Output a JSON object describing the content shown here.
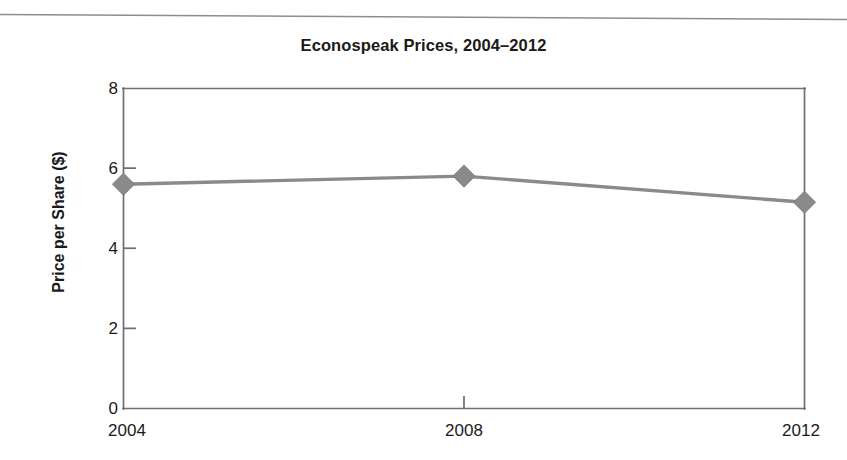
{
  "chart_data": {
    "type": "line",
    "title": "Econospeak Prices, 2004–2012",
    "xlabel": "",
    "ylabel": "Price per Share ($)",
    "x": [
      2004,
      2008,
      2012
    ],
    "xticklabels": [
      "2004",
      "2008",
      "2012"
    ],
    "yticklabels": [
      "0",
      "2",
      "4",
      "6",
      "8"
    ],
    "yticks": [
      0,
      2,
      4,
      6,
      8
    ],
    "ylim": [
      0,
      8
    ],
    "xlim": [
      2004,
      2012
    ],
    "grid": false,
    "legend": false,
    "marker": "diamond",
    "series": [
      {
        "name": "Price per Share",
        "values": [
          5.6,
          5.8,
          5.15
        ]
      }
    ],
    "colors": {
      "line": "#8a8a8a",
      "marker": "#8a8a8a",
      "axis": "#6e6e6e",
      "text": "#1a1a1a",
      "background": "#ffffff"
    }
  },
  "axis": {
    "y_labels": [
      "8",
      "6",
      "4",
      "2",
      "0"
    ],
    "x_labels": [
      "2004",
      "2008",
      "2012"
    ],
    "y_title": "Price per Share ($)"
  },
  "page": {
    "title": "Econospeak Prices, 2004–2012"
  }
}
